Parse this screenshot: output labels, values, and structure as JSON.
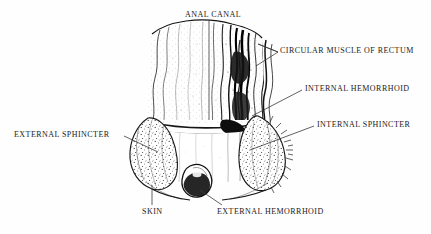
{
  "figure": {
    "style": "pen-and-ink stippled medical illustration",
    "background_color": "#fefefe",
    "ink_color": "#111111",
    "leader_color": "#3a3a3a"
  },
  "labels": {
    "anal_canal": "ANAL CANAL",
    "circular_muscle": "CIRCULAR MUSCLE OF RECTUM",
    "internal_hemorrhoid": "INTERNAL HEMORRHOID",
    "internal_sphincter": "INTERNAL SPHINCTER",
    "external_sphincter": "EXTERNAL SPHINCTER",
    "skin": "SKIN",
    "external_hemorrhoid": "EXTERNAL HEMORRHOID"
  }
}
